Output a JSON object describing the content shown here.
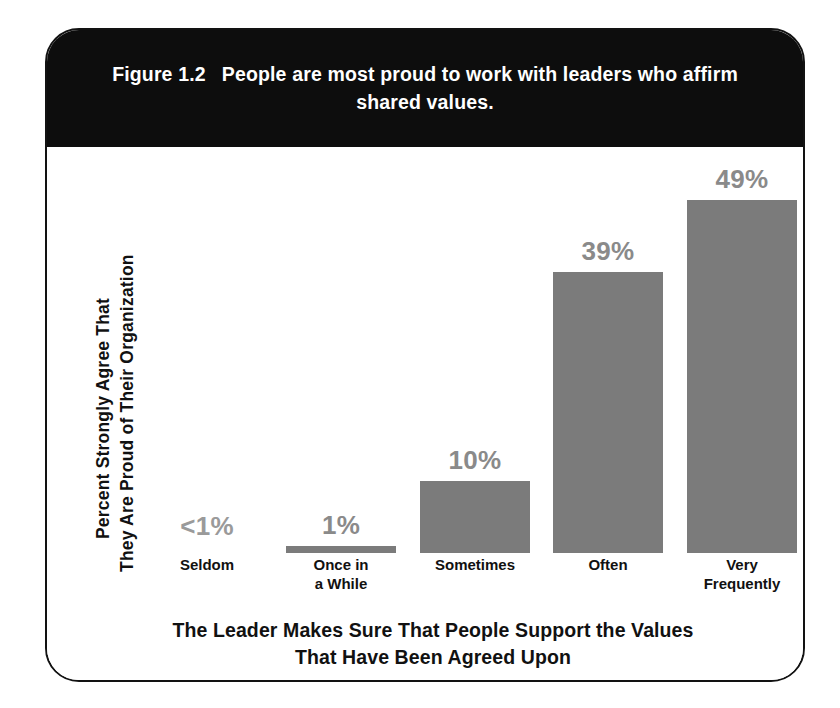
{
  "figure": {
    "number": "Figure 1.2",
    "caption": "People are most proud to work with leaders who affirm shared values.",
    "frame_color": "#121212",
    "band_color": "#0d0d0d",
    "bar_color": "#7b7b7b",
    "value_label_color": "#8a8a8a"
  },
  "chart_data": {
    "type": "bar",
    "xlabel": "The Leader Makes Sure That People Support the Values That Have Been Agreed Upon",
    "ylabel": "Percent Strongly Agree That They Are Proud of Their Organization",
    "ylabel_line_1": "Percent Strongly Agree That",
    "ylabel_line_2": "They Are Proud of Their Organization",
    "xlabel_line_1": "The Leader Makes Sure That People Support the Values",
    "xlabel_line_2": "That Have Been Agreed Upon",
    "categories": [
      "Seldom",
      "Once in a While",
      "Sometimes",
      "Often",
      "Very Frequently"
    ],
    "category_lines": [
      [
        "Seldom"
      ],
      [
        "Once in",
        "a While"
      ],
      [
        "Sometimes"
      ],
      [
        "Often"
      ],
      [
        "Very",
        "Frequently"
      ]
    ],
    "values": [
      0.5,
      1,
      10,
      39,
      49
    ],
    "data_labels": [
      "<1%",
      "1%",
      "10%",
      "39%",
      "49%"
    ],
    "ylim": [
      0,
      55
    ],
    "grid": false,
    "legend": false
  }
}
